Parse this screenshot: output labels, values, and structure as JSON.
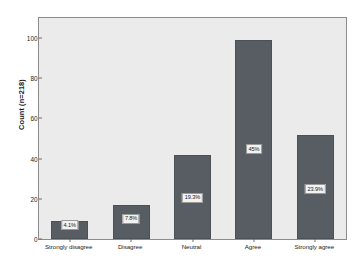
{
  "chart_data": {
    "type": "bar",
    "title": "",
    "subtitle": "",
    "xlabel": "",
    "ylabel": "Count (n=218)",
    "categories": [
      "Strongly disagree",
      "Disagree",
      "Neutral",
      "Agree",
      "Strongly agree"
    ],
    "values": [
      9,
      17,
      42,
      99,
      52
    ],
    "data_labels": [
      "4.1%",
      "7.8%",
      "19.3%",
      "45%",
      "23.9%"
    ],
    "ylim": [
      0,
      110
    ],
    "yticks": [
      0,
      20,
      40,
      60,
      80,
      100
    ],
    "ytick_labels": [
      "0",
      "20",
      "40",
      "60",
      "80",
      "100"
    ],
    "grid": false,
    "legend": false,
    "n_total": 218,
    "colors": {
      "bar": "#585c63",
      "bar_edge": "#4c5057",
      "plot_background": "#ebebeb",
      "figure_background": "#ffffff",
      "axis": "#8c8c8c",
      "text": "#1b1b1b",
      "label_box": "#f2f2f2"
    }
  }
}
